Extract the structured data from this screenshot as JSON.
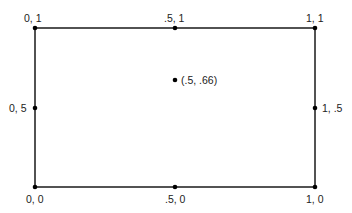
{
  "diagram": {
    "rect": {
      "x1": 35,
      "y1": 28,
      "x2": 315,
      "y2": 187,
      "stroke": "#1a1a1a",
      "stroke_width": 1.5
    },
    "points": [
      {
        "id": "top-left",
        "label": "0, 1",
        "x": 35,
        "y": 28,
        "label_x": 24,
        "label_y": 12
      },
      {
        "id": "top-middle",
        "label": ".5, 1",
        "x": 175,
        "y": 28,
        "label_x": 164,
        "label_y": 12
      },
      {
        "id": "top-right",
        "label": "1, 1",
        "x": 315,
        "y": 28,
        "label_x": 306,
        "label_y": 12
      },
      {
        "id": "middle-left",
        "label": "0, 5",
        "x": 35,
        "y": 108,
        "label_x": 9,
        "label_y": 102
      },
      {
        "id": "center",
        "label": "(.5, .66)",
        "x": 175,
        "y": 80,
        "label_x": 181,
        "label_y": 74
      },
      {
        "id": "middle-right",
        "label": "1, .5",
        "x": 315,
        "y": 108,
        "label_x": 322,
        "label_y": 102
      },
      {
        "id": "bottom-left",
        "label": "0, 0",
        "x": 35,
        "y": 187,
        "label_x": 26,
        "label_y": 193
      },
      {
        "id": "bottom-middle",
        "label": ".5, 0",
        "x": 175,
        "y": 187,
        "label_x": 165,
        "label_y": 193
      },
      {
        "id": "bottom-right",
        "label": "1, 0",
        "x": 315,
        "y": 187,
        "label_x": 306,
        "label_y": 193
      }
    ],
    "point_color": "#000000",
    "point_radius": 2.3
  }
}
